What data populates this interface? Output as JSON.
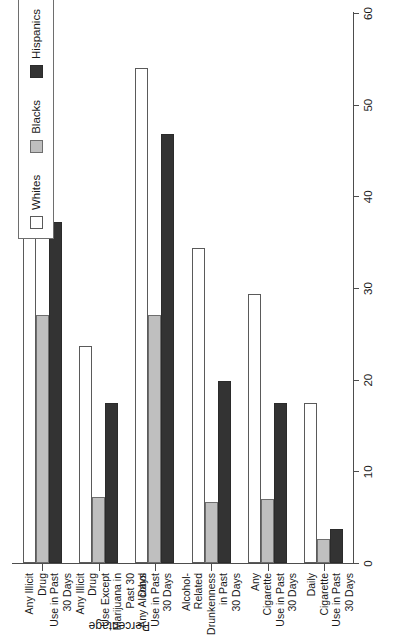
{
  "chart_data": {
    "type": "bar",
    "title": "",
    "xlabel": "",
    "ylabel": "Percentage",
    "ylim": [
      0,
      60
    ],
    "yticks": [
      0,
      10,
      20,
      30,
      40,
      50,
      60
    ],
    "grid": false,
    "legend_position": "top-right",
    "orientation": "vertical-bars-rotated",
    "categories": [
      "Any Illicit Drug\nUse in Past\n30 Days",
      "Any Illicit Drug\nUse Except\nMarijuana in\nPast 30 Days",
      "Any Alcohol\nUse in Past\n30 Days",
      "Alcohol-\nRelated\nDrunkenness\nin Past\n30 Days",
      "Any Cigarette\nUse in Past\n30 Days",
      "Daily Cigarette\nUse in Past\n30 Days"
    ],
    "category_lines": [
      [
        "Any Illicit Drug",
        "Use in Past",
        "30 Days"
      ],
      [
        "Any Illicit Drug",
        "Use Except",
        "Marijuana in",
        "Past 30 Days"
      ],
      [
        "Any Alcohol",
        "Use in Past",
        "30 Days"
      ],
      [
        "Alcohol-",
        "Related",
        "Drunkenness",
        "in Past",
        "30 Days"
      ],
      [
        "Any Cigarette",
        "Use in Past",
        "30 Days"
      ],
      [
        "Daily Cigarette",
        "Use in Past",
        "30 Days"
      ]
    ],
    "series": [
      {
        "name": "Whites",
        "color": "#ffffff",
        "values": [
          42.5,
          23.7,
          54.0,
          34.4,
          29.3,
          17.5
        ]
      },
      {
        "name": "Blacks",
        "color": "#bfbfbf",
        "values": [
          27.1,
          7.2,
          27.1,
          6.6,
          7.0,
          2.6
        ]
      },
      {
        "name": "Hispanics",
        "color": "#333333",
        "values": [
          37.2,
          17.5,
          46.8,
          19.9,
          17.5,
          3.7
        ]
      }
    ]
  },
  "axis": {
    "value_title": "Percentage",
    "tick_labels": [
      "0",
      "10",
      "20",
      "30",
      "40",
      "50",
      "60"
    ]
  },
  "legend": {
    "items": [
      {
        "label": "Whites",
        "swatch": "whites"
      },
      {
        "label": "Blacks",
        "swatch": "blacks"
      },
      {
        "label": "Hispanics",
        "swatch": "hispanics"
      }
    ]
  }
}
